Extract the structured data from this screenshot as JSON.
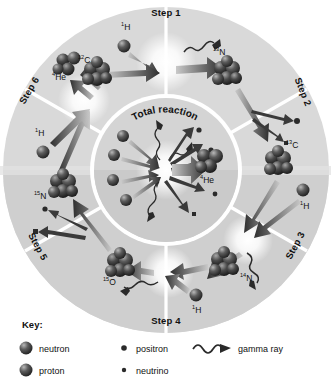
{
  "diagram": {
    "name": "CNO cycle diagram",
    "center_label": "Total reaction",
    "colors": {
      "background": "#ffffff",
      "ring_light": "#d9d9d9",
      "ring_dark": "#c6c6c6",
      "center_disc": "#d2d2d2",
      "divider": "#ffffff",
      "text": "#111111",
      "nucleus_dark": "#2b2b2b",
      "nucleus_light": "#8d8d8d",
      "arrow_dark": "#3a3a3a",
      "arrow_light": "#b5b5b5",
      "burst": "#ffffff"
    },
    "steps": [
      {
        "id": "step1",
        "label": "Step 1",
        "reactants": [
          "12C",
          "1H"
        ],
        "products": [
          "13N",
          "gamma ray"
        ]
      },
      {
        "id": "step2",
        "label": "Step 2",
        "reactants": [
          "13N"
        ],
        "products": [
          "13C",
          "positron",
          "neutrino"
        ]
      },
      {
        "id": "step3",
        "label": "Step 3",
        "reactants": [
          "13C",
          "1H"
        ],
        "products": [
          "14N",
          "gamma ray"
        ]
      },
      {
        "id": "step4",
        "label": "Step 4",
        "reactants": [
          "14N",
          "1H"
        ],
        "products": [
          "15O",
          "gamma ray"
        ]
      },
      {
        "id": "step5",
        "label": "Step 5",
        "reactants": [
          "15O"
        ],
        "products": [
          "15N",
          "positron",
          "neutrino"
        ]
      },
      {
        "id": "step6",
        "label": "Step 6",
        "reactants": [
          "15N",
          "1H"
        ],
        "products": [
          "12C",
          "4He"
        ]
      }
    ],
    "nuclei": [
      {
        "id": "c12",
        "mass": "12",
        "symbol": "C",
        "label": "12C",
        "x": 97,
        "y": 74,
        "r": 12.5
      },
      {
        "id": "h1a",
        "mass": "1",
        "symbol": "H",
        "label": "1H",
        "x": 124,
        "y": 46,
        "r": 6.0
      },
      {
        "id": "n13",
        "mass": "13",
        "symbol": "N",
        "label": "13N",
        "x": 227,
        "y": 73,
        "r": 12.5
      },
      {
        "id": "c13",
        "mass": "13",
        "symbol": "C",
        "label": "13C",
        "x": 278,
        "y": 163,
        "r": 12.0
      },
      {
        "id": "h1b",
        "mass": "1",
        "symbol": "H",
        "label": "1H",
        "x": 303,
        "y": 190,
        "r": 6.0
      },
      {
        "id": "n14",
        "mass": "14",
        "symbol": "N",
        "label": "14N",
        "x": 224,
        "y": 264,
        "r": 12.5
      },
      {
        "id": "h1c",
        "mass": "1",
        "symbol": "H",
        "label": "1H",
        "x": 196,
        "y": 295,
        "r": 6.0
      },
      {
        "id": "o15",
        "mass": "15",
        "symbol": "O",
        "label": "15O",
        "x": 120,
        "y": 265,
        "r": 12.5
      },
      {
        "id": "n15",
        "mass": "15",
        "symbol": "N",
        "label": "15N",
        "x": 63,
        "y": 186,
        "r": 12.5
      },
      {
        "id": "h1d",
        "mass": "1",
        "symbol": "H",
        "label": "1H",
        "x": 43,
        "y": 152,
        "r": 6.0
      },
      {
        "id": "he4",
        "mass": "4",
        "symbol": "He",
        "label": "4He",
        "x": 68,
        "y": 64,
        "r": 9.5
      },
      {
        "id": "he4c",
        "mass": "4",
        "symbol": "He",
        "label": "4He",
        "x": 209,
        "y": 160,
        "r": 11.0
      }
    ],
    "isotope_labels": [
      {
        "for": "c12",
        "mass": "12",
        "symbol": "C",
        "x": 78,
        "y": 63
      },
      {
        "for": "h1a",
        "mass": "1",
        "symbol": "H",
        "x": 121,
        "y": 30
      },
      {
        "for": "n13",
        "mass": "13",
        "symbol": "N",
        "x": 213,
        "y": 55
      },
      {
        "for": "c13",
        "mass": "13",
        "symbol": "C",
        "x": 286,
        "y": 148
      },
      {
        "for": "h1b",
        "mass": "1",
        "symbol": "H",
        "x": 300,
        "y": 209
      },
      {
        "for": "n14",
        "mass": "14",
        "symbol": "N",
        "x": 240,
        "y": 281
      },
      {
        "for": "h1c",
        "mass": "1",
        "symbol": "H",
        "x": 192,
        "y": 313
      },
      {
        "for": "o15",
        "mass": "15",
        "symbol": "O",
        "x": 103,
        "y": 285
      },
      {
        "for": "n15",
        "mass": "15",
        "symbol": "N",
        "x": 34,
        "y": 199
      },
      {
        "for": "h1d",
        "mass": "1",
        "symbol": "H",
        "x": 35,
        "y": 136
      },
      {
        "for": "he4",
        "mass": "4",
        "symbol": "He",
        "x": 52,
        "y": 80
      },
      {
        "for": "he4c",
        "mass": "4",
        "symbol": "He",
        "x": 200,
        "y": 183
      }
    ],
    "step_label_placement": [
      {
        "id": "step1",
        "x": 166,
        "y": 16,
        "rotate": 0
      },
      {
        "id": "step2",
        "x": 300,
        "y": 93,
        "rotate": 68
      },
      {
        "id": "step3",
        "x": 298,
        "y": 247,
        "rotate": -62
      },
      {
        "id": "step4",
        "x": 166,
        "y": 324,
        "rotate": 0
      },
      {
        "id": "step5",
        "x": 35,
        "y": 248,
        "rotate": 62
      },
      {
        "id": "step6",
        "x": 32,
        "y": 92,
        "rotate": -60
      }
    ],
    "total_reaction": {
      "title": "Total reaction",
      "inputs": [
        "1H",
        "1H",
        "1H",
        "1H"
      ],
      "output": "4He",
      "emissions": [
        "gamma ray",
        "gamma ray",
        "gamma ray",
        "positron",
        "positron",
        "neutrino",
        "neutrino"
      ]
    }
  },
  "key": {
    "title": "Key:",
    "items": [
      {
        "id": "neutron",
        "label": "neutron",
        "glyph": "sphere-dark",
        "col": 0,
        "row": 0
      },
      {
        "id": "proton",
        "label": "proton",
        "glyph": "sphere-dark",
        "col": 0,
        "row": 1
      },
      {
        "id": "positron",
        "label": "positron",
        "glyph": "dot-small",
        "col": 1,
        "row": 0
      },
      {
        "id": "neutrino",
        "label": "neutrino",
        "glyph": "dot-tiny",
        "col": 1,
        "row": 1
      },
      {
        "id": "gammaray",
        "label": "gamma ray",
        "glyph": "wavy-arrow",
        "col": 2,
        "row": 0
      }
    ]
  }
}
